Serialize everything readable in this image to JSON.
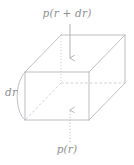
{
  "figure": {
    "kind": "3d-box-pressure-element",
    "background_color": "#ffffff",
    "line_color": "#b8b8bd",
    "hidden_line_color": "#c9c9ce",
    "arrow_color": "#b0b0b5",
    "label_color": "#8f8f93"
  },
  "labels": {
    "top": "p(r + dr)",
    "bottom": "p(r)",
    "left": "dr"
  },
  "arrows": {
    "top": {
      "name": "pressure-in-arrow",
      "direction": "down",
      "style": "solid",
      "from": [
        70,
        24
      ],
      "to": [
        70,
        60
      ]
    },
    "bottom": {
      "name": "pressure-out-arrow",
      "direction": "up",
      "style": "dotted",
      "from": [
        70,
        142
      ],
      "to": [
        70,
        108
      ]
    }
  },
  "geometry": {
    "front_face": {
      "x1": 25,
      "y1": 72,
      "x2": 89,
      "y2": 120
    },
    "depth_offset": {
      "dx": 36,
      "dy": -37
    },
    "arc": {
      "name": "radial-curvature-arc",
      "from": [
        25,
        120
      ],
      "to": [
        25,
        72
      ],
      "bulge": -11
    }
  }
}
